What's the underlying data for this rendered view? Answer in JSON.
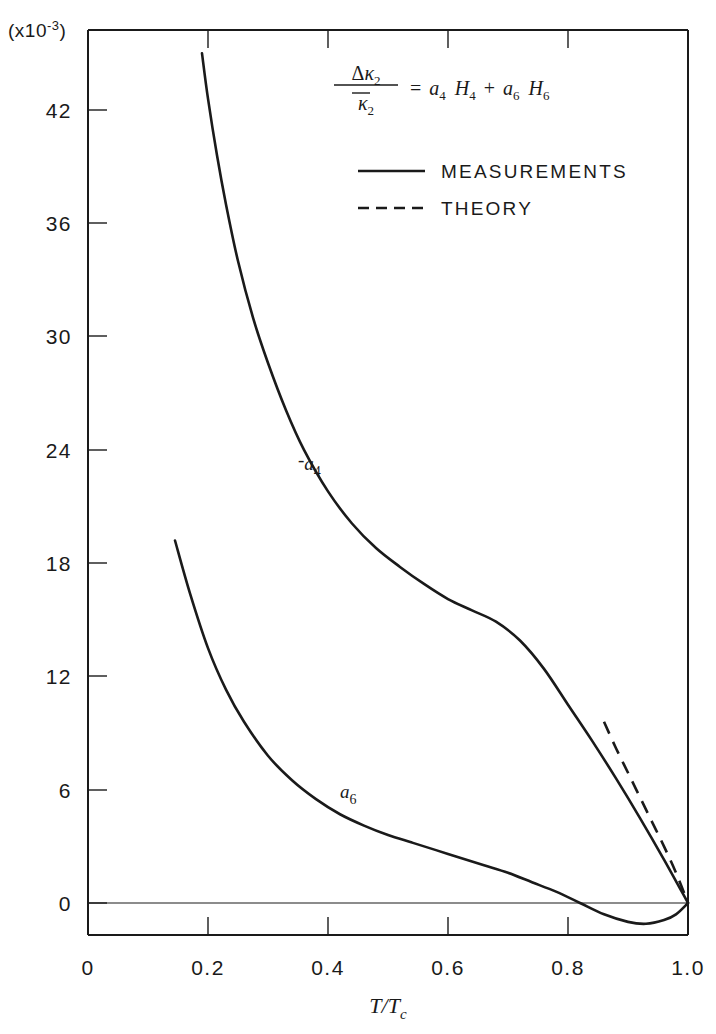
{
  "chart_data": {
    "type": "line",
    "title": "",
    "xlabel": "T/Tc",
    "ylabel": "",
    "y_unit_label": "(x10-3)",
    "xlim": [
      0,
      1.0
    ],
    "ylim": [
      -3,
      45
    ],
    "grid": false,
    "legend_position": "top-right",
    "xticks": [
      "0",
      "0.2",
      "0.4",
      "0.6",
      "0.8",
      "1.0"
    ],
    "xtick_values": [
      0,
      0.2,
      0.4,
      0.6,
      0.8,
      1.0
    ],
    "yticks": [
      "0",
      "6",
      "12",
      "18",
      "24",
      "30",
      "36",
      "42"
    ],
    "ytick_values": [
      0,
      6,
      12,
      18,
      24,
      30,
      36,
      42
    ],
    "annotations": [
      {
        "id": "equation",
        "text": "Δκ2/κ̄2 = a4 H4 + a6 H6"
      },
      {
        "id": "curve-label-a4",
        "text": "-a4"
      },
      {
        "id": "curve-label-a6",
        "text": "a6"
      }
    ],
    "series": [
      {
        "name": "-a4",
        "label": "-a4",
        "style": "solid",
        "legend": "MEASUREMENTS",
        "x": [
          0.19,
          0.2,
          0.215,
          0.23,
          0.25,
          0.275,
          0.3,
          0.33,
          0.36,
          0.4,
          0.44,
          0.48,
          0.52,
          0.56,
          0.6,
          0.64,
          0.68,
          0.72,
          0.76,
          0.8,
          0.84,
          0.88,
          0.92,
          0.96,
          1.0
        ],
        "y": [
          45.0,
          42.6,
          39.6,
          37.0,
          34.0,
          31.0,
          28.6,
          26.1,
          24.0,
          21.8,
          20.1,
          18.8,
          17.8,
          16.9,
          16.1,
          15.5,
          14.9,
          13.9,
          12.4,
          10.5,
          8.6,
          6.6,
          4.5,
          2.3,
          0.0
        ]
      },
      {
        "name": "a6",
        "label": "a6",
        "style": "solid",
        "legend": "MEASUREMENTS",
        "x": [
          0.145,
          0.17,
          0.2,
          0.23,
          0.26,
          0.3,
          0.34,
          0.38,
          0.42,
          0.46,
          0.5,
          0.54,
          0.58,
          0.62,
          0.66,
          0.7,
          0.74,
          0.78,
          0.82,
          0.86,
          0.9,
          0.93,
          0.96,
          0.98,
          1.0
        ],
        "y": [
          19.2,
          16.4,
          13.5,
          11.3,
          9.6,
          7.8,
          6.5,
          5.5,
          4.7,
          4.1,
          3.6,
          3.2,
          2.8,
          2.4,
          2.0,
          1.6,
          1.1,
          0.6,
          0.0,
          -0.6,
          -1.0,
          -1.1,
          -0.9,
          -0.6,
          0.0
        ]
      },
      {
        "name": "theory",
        "label": "THEORY",
        "style": "dashed",
        "legend": "THEORY",
        "x": [
          0.86,
          0.88,
          0.9,
          0.92,
          0.94,
          0.96,
          0.98,
          1.0
        ],
        "y": [
          9.6,
          8.2,
          6.9,
          5.6,
          4.3,
          3.0,
          1.6,
          0.0
        ]
      }
    ],
    "legend_entries": [
      {
        "label": "MEASUREMENTS",
        "style": "solid"
      },
      {
        "label": "THEORY",
        "style": "dashed"
      }
    ]
  },
  "equation": {
    "delta": "Δ",
    "kappa": "κ",
    "num_sub": "2",
    "den_kappa": "κ",
    "den_sub": "2",
    "equals": "=",
    "a1": "a",
    "a1_sub": "4",
    "h1": "H",
    "h1_sub": "4",
    "plus": "+",
    "a2": "a",
    "a2_sub": "6",
    "h2": "H",
    "h2_sub": "6"
  },
  "axes": {
    "y_unit_prefix": "(x10",
    "y_unit_exp": "-3",
    "y_unit_suffix": ")",
    "x_title_num": "T",
    "x_title_slash": "/",
    "x_title_den": "T",
    "x_title_den_sub": "c"
  },
  "labels": {
    "a4_minus": "-",
    "a4_base": "a",
    "a4_sub": "4",
    "a6_base": "a",
    "a6_sub": "6"
  },
  "colors": {
    "ink": "#1a1a1a",
    "background": "#ffffff"
  }
}
